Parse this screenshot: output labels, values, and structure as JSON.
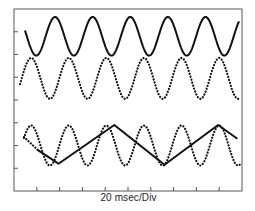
{
  "chart_data": {
    "type": "line",
    "title": "",
    "xlabel": "20 msec/Div",
    "ylabel": "",
    "grid": false,
    "legend": null,
    "frame": {
      "divisions_x": 10,
      "divisions_y": 8,
      "tick_marks": true
    },
    "x_unit": "msec",
    "x_per_division": 20,
    "x_range_msec": [
      0,
      200
    ],
    "series": [
      {
        "name": "trace-1-solid-sine",
        "style": "solid",
        "shape": "sine",
        "period_msec": 33,
        "cycles_visible": 6,
        "peaks_x_msec": [
          3,
          36,
          69,
          101,
          134,
          176
        ],
        "center_div_from_top": 1.2,
        "amplitude_div": 0.85
      },
      {
        "name": "trace-2-dotted-sine",
        "style": "dotted",
        "shape": "sine",
        "period_msec": 33,
        "cycles_visible": 6,
        "peaks_x_msec": [
          15,
          47,
          80,
          112,
          145,
          177
        ],
        "center_div_from_top": 3.05,
        "amplitude_div": 0.9
      },
      {
        "name": "trace-3-dotted-sine",
        "style": "dotted",
        "shape": "sine",
        "period_msec": 33,
        "cycles_visible": 6,
        "peaks_x_msec": [
          15,
          47,
          80,
          112,
          145,
          177
        ],
        "center_div_from_top": 6.0,
        "amplitude_div": 0.88
      },
      {
        "name": "trace-3-solid-triangle",
        "style": "solid",
        "shape": "triangle",
        "vertices_x_msec": [
          21,
          39,
          88,
          132,
          179,
          196
        ],
        "vertices_y_div_from_top": [
          6.2,
          6.8,
          5.1,
          6.85,
          5.1,
          5.7
        ]
      }
    ],
    "ylim": [
      0,
      8
    ],
    "xlim": [
      0,
      10
    ]
  },
  "frame_px": {
    "left": 14,
    "top": 9,
    "right": 242,
    "bottom": 191
  },
  "colors": {
    "trace": "#111111",
    "frame": "#555555",
    "background": "#ffffff"
  }
}
